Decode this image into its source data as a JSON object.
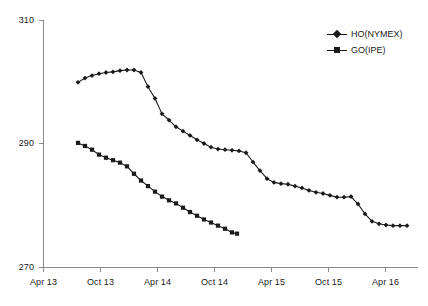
{
  "chart_data": {
    "type": "line",
    "title": "",
    "subtitle": "",
    "xlabel": "",
    "ylabel": "",
    "ylim": [
      270,
      310
    ],
    "yticks": [
      270,
      290,
      310
    ],
    "ytick_labels": [
      "270",
      "290",
      "310"
    ],
    "xticks": [
      "Apr 13",
      "Oct 13",
      "Apr 14",
      "Oct 14",
      "Apr 15",
      "Oct 15",
      "Apr 16"
    ],
    "grid": false,
    "legend_position": "top-right",
    "series": [
      {
        "name": "HO(NYMEX)",
        "marker": "diamond",
        "color": "#1a1a1a",
        "points": [
          {
            "x": 78,
            "y": 299.9
          },
          {
            "x": 85,
            "y": 300.6
          },
          {
            "x": 92,
            "y": 301.0
          },
          {
            "x": 99,
            "y": 301.3
          },
          {
            "x": 106,
            "y": 301.5
          },
          {
            "x": 113,
            "y": 301.6
          },
          {
            "x": 120,
            "y": 301.8
          },
          {
            "x": 127,
            "y": 301.9
          },
          {
            "x": 134,
            "y": 301.9
          },
          {
            "x": 141,
            "y": 301.5
          },
          {
            "x": 148,
            "y": 299.2
          },
          {
            "x": 155,
            "y": 297.3
          },
          {
            "x": 162,
            "y": 294.8
          },
          {
            "x": 169,
            "y": 293.8
          },
          {
            "x": 176,
            "y": 292.7
          },
          {
            "x": 183,
            "y": 292.0
          },
          {
            "x": 190,
            "y": 291.3
          },
          {
            "x": 197,
            "y": 290.6
          },
          {
            "x": 204,
            "y": 290.0
          },
          {
            "x": 211,
            "y": 289.4
          },
          {
            "x": 218,
            "y": 289.1
          },
          {
            "x": 225,
            "y": 289.0
          },
          {
            "x": 232,
            "y": 288.9
          },
          {
            "x": 239,
            "y": 288.8
          },
          {
            "x": 246,
            "y": 288.5
          },
          {
            "x": 253,
            "y": 287.0
          },
          {
            "x": 260,
            "y": 285.6
          },
          {
            "x": 267,
            "y": 284.3
          },
          {
            "x": 274,
            "y": 283.7
          },
          {
            "x": 281,
            "y": 283.5
          },
          {
            "x": 288,
            "y": 283.4
          },
          {
            "x": 295,
            "y": 283.1
          },
          {
            "x": 302,
            "y": 282.8
          },
          {
            "x": 309,
            "y": 282.4
          },
          {
            "x": 316,
            "y": 282.1
          },
          {
            "x": 323,
            "y": 281.9
          },
          {
            "x": 330,
            "y": 281.6
          },
          {
            "x": 337,
            "y": 281.3
          },
          {
            "x": 344,
            "y": 281.3
          },
          {
            "x": 351,
            "y": 281.4
          },
          {
            "x": 358,
            "y": 280.2
          },
          {
            "x": 365,
            "y": 278.6
          },
          {
            "x": 372,
            "y": 277.4
          },
          {
            "x": 379,
            "y": 277.0
          },
          {
            "x": 386,
            "y": 276.8
          },
          {
            "x": 393,
            "y": 276.7
          },
          {
            "x": 400,
            "y": 276.7
          },
          {
            "x": 407,
            "y": 276.7
          }
        ]
      },
      {
        "name": "GO(IPE)",
        "marker": "square",
        "color": "#1a1a1a",
        "points": [
          {
            "x": 78,
            "y": 290.1
          },
          {
            "x": 85,
            "y": 289.6
          },
          {
            "x": 92,
            "y": 289.0
          },
          {
            "x": 99,
            "y": 288.2
          },
          {
            "x": 106,
            "y": 287.7
          },
          {
            "x": 113,
            "y": 287.3
          },
          {
            "x": 120,
            "y": 286.9
          },
          {
            "x": 127,
            "y": 286.3
          },
          {
            "x": 134,
            "y": 285.1
          },
          {
            "x": 141,
            "y": 284.0
          },
          {
            "x": 148,
            "y": 283.1
          },
          {
            "x": 155,
            "y": 282.2
          },
          {
            "x": 162,
            "y": 281.4
          },
          {
            "x": 169,
            "y": 280.8
          },
          {
            "x": 176,
            "y": 280.3
          },
          {
            "x": 183,
            "y": 279.6
          },
          {
            "x": 190,
            "y": 278.9
          },
          {
            "x": 197,
            "y": 278.3
          },
          {
            "x": 204,
            "y": 277.7
          },
          {
            "x": 211,
            "y": 277.2
          },
          {
            "x": 218,
            "y": 276.7
          },
          {
            "x": 225,
            "y": 276.2
          },
          {
            "x": 232,
            "y": 275.6
          },
          {
            "x": 237,
            "y": 275.4
          }
        ]
      }
    ]
  },
  "legend": {
    "entries": [
      {
        "label": "HO(NYMEX)"
      },
      {
        "label": "GO(IPE)"
      }
    ]
  },
  "axes": {
    "y_labels": [
      "310",
      "290",
      "270"
    ],
    "x_labels": [
      "Apr 13",
      "Oct 13",
      "Apr 14",
      "Oct 14",
      "Apr 15",
      "Oct 15",
      "Apr 16"
    ]
  }
}
